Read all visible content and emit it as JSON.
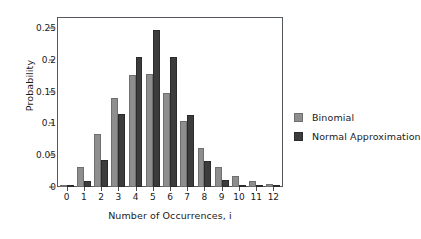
{
  "chart_data": {
    "type": "bar",
    "title": "",
    "xlabel": "Number of Occurrences, i",
    "ylabel": "Probability",
    "categories": [
      "0",
      "1",
      "2",
      "3",
      "4",
      "5",
      "6",
      "7",
      "8",
      "9",
      "10",
      "11",
      "12"
    ],
    "series": [
      {
        "name": "Binomial",
        "color": "#8e8e8e",
        "values": [
          0.003,
          0.032,
          0.083,
          0.14,
          0.176,
          0.177,
          0.147,
          0.104,
          0.062,
          0.032,
          0.017,
          0.009,
          0.005
        ]
      },
      {
        "name": "Normal Approximation",
        "color": "#3c3c3c",
        "values": [
          0.001,
          0.01,
          0.042,
          0.114,
          0.204,
          0.247,
          0.204,
          0.113,
          0.041,
          0.011,
          0.002,
          0.0,
          0.0
        ]
      }
    ],
    "ylim": [
      0,
      0.2656
    ],
    "xlim": [
      -0.5,
      12.5
    ],
    "yticks": [
      0,
      0.05,
      0.1,
      0.15,
      0.2,
      0.25
    ],
    "ytick_labels": [
      "0",
      "0.05",
      "0.1",
      "0.15",
      "0.2",
      "0.25"
    ],
    "grid": false,
    "legend_position": "right",
    "frame": true
  },
  "legend": {
    "items": [
      {
        "label": "Binomial",
        "swatch": "binomial"
      },
      {
        "label": "Normal Approximation",
        "swatch": "normal"
      }
    ]
  }
}
